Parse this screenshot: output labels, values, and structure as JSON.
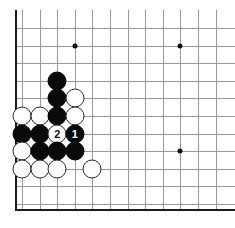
{
  "figure": {
    "kind": "go-board-diagram",
    "title": "",
    "corner": "upper-left",
    "board_size": 19,
    "colors": {
      "board_background": "#ffffff",
      "grid_line": "#9a9a9a",
      "board_edge": "#1a1a1a",
      "black_stone": "#0a0a0a",
      "white_stone": "#ffffff",
      "stone_outline": "#2a2a2a",
      "star_point": "#111111"
    }
  },
  "geometry": {
    "origin_x": 22,
    "origin_y": 28,
    "cell": 17.6,
    "cols": 12,
    "rows": 11,
    "stone_diameter": 19,
    "edge_left_x": 15,
    "edge_bottom_y": 209
  },
  "star_points": [
    {
      "name": "star-point-d16",
      "col": 3,
      "row": 1
    },
    {
      "name": "star-point-k16",
      "col": 9,
      "row": 1
    },
    {
      "name": "star-point-k10",
      "col": 9,
      "row": 7
    }
  ],
  "stones": [
    {
      "name": "stone-black-c13",
      "color": "black",
      "col": 2,
      "row": 3,
      "label": ""
    },
    {
      "name": "stone-black-c12",
      "color": "black",
      "col": 2,
      "row": 4,
      "label": ""
    },
    {
      "name": "stone-white-d12",
      "color": "white",
      "col": 3,
      "row": 4,
      "label": ""
    },
    {
      "name": "stone-white-a11",
      "color": "white",
      "col": 0,
      "row": 5,
      "label": ""
    },
    {
      "name": "stone-white-b11",
      "color": "white",
      "col": 1,
      "row": 5,
      "label": ""
    },
    {
      "name": "stone-black-c11",
      "color": "black",
      "col": 2,
      "row": 5,
      "label": ""
    },
    {
      "name": "stone-white-d11",
      "color": "white",
      "col": 3,
      "row": 5,
      "label": ""
    },
    {
      "name": "stone-black-a10",
      "color": "black",
      "col": 0,
      "row": 6,
      "label": ""
    },
    {
      "name": "stone-black-b10",
      "color": "black",
      "col": 1,
      "row": 6,
      "label": ""
    },
    {
      "name": "stone-white-move-2",
      "color": "white",
      "col": 2,
      "row": 6,
      "label": "2"
    },
    {
      "name": "stone-black-move-1",
      "color": "black",
      "col": 3,
      "row": 6,
      "label": "1"
    },
    {
      "name": "stone-white-a9",
      "color": "white",
      "col": 0,
      "row": 7,
      "label": ""
    },
    {
      "name": "stone-black-b9",
      "color": "black",
      "col": 1,
      "row": 7,
      "label": ""
    },
    {
      "name": "stone-black-c9",
      "color": "black",
      "col": 2,
      "row": 7,
      "label": ""
    },
    {
      "name": "stone-black-d9",
      "color": "black",
      "col": 3,
      "row": 7,
      "label": ""
    },
    {
      "name": "stone-white-a8",
      "color": "white",
      "col": 0,
      "row": 8,
      "label": ""
    },
    {
      "name": "stone-white-b8",
      "color": "white",
      "col": 1,
      "row": 8,
      "label": ""
    },
    {
      "name": "stone-white-c8",
      "color": "white",
      "col": 2,
      "row": 8,
      "label": ""
    },
    {
      "name": "stone-white-e8",
      "color": "white",
      "col": 4,
      "row": 8,
      "label": ""
    }
  ],
  "move_labels": {
    "move_1": "1",
    "move_2": "2"
  }
}
